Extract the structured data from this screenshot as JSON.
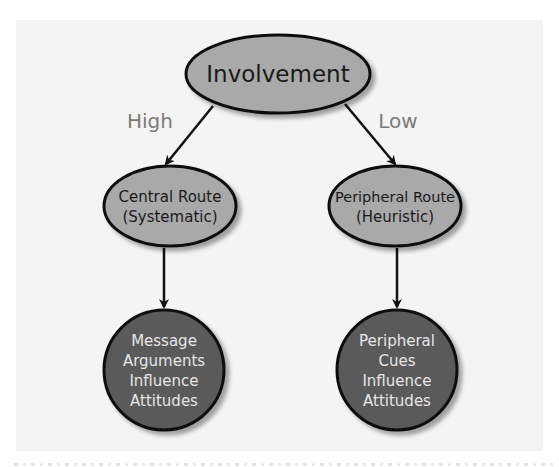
{
  "diagram": {
    "type": "flowchart",
    "root": {
      "label": "Involvement",
      "fill": "#a9a9a9"
    },
    "edges": {
      "left_label": "High",
      "right_label": "Low"
    },
    "routes": [
      {
        "line1": "Central Route",
        "line2": "(Systematic)",
        "fill": "#a9a9a9"
      },
      {
        "line1": "Peripheral Route",
        "line2": "(Heuristic)",
        "fill": "#a9a9a9"
      }
    ],
    "outcomes": [
      {
        "lines": [
          "Message",
          "Arguments",
          "Influence",
          "Attitudes"
        ],
        "fill": "#5a5a5a"
      },
      {
        "lines": [
          "Peripheral",
          "Cues",
          "Influence",
          "Attitudes"
        ],
        "fill": "#5a5a5a"
      }
    ],
    "colors": {
      "background": "#f4f4f4",
      "stroke": "#111111",
      "edge_label": "#7a7a7a",
      "dark_text": "#1a1a1a",
      "light_text": "#e6e6e6"
    }
  }
}
